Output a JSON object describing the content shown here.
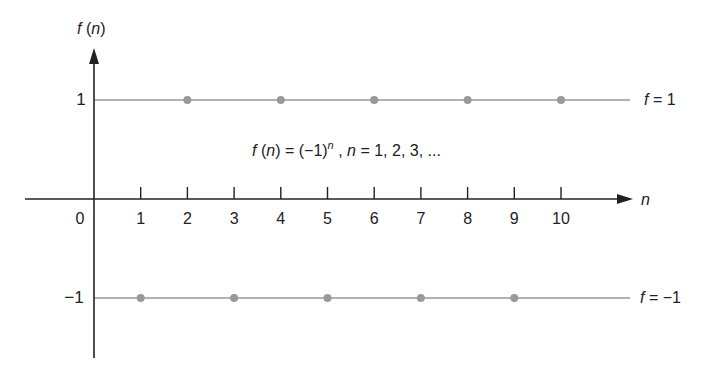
{
  "chart_data": {
    "type": "scatter",
    "xlabel": "n",
    "ylabel": "f (n)",
    "x": [
      1,
      2,
      3,
      4,
      5,
      6,
      7,
      8,
      9,
      10
    ],
    "series": [
      {
        "name": "f(n)",
        "values": [
          -1,
          1,
          -1,
          1,
          -1,
          1,
          -1,
          1,
          -1,
          1
        ]
      }
    ],
    "x_ticks": [
      "1",
      "2",
      "3",
      "4",
      "5",
      "6",
      "7",
      "8",
      "9",
      "10"
    ],
    "y_ticks": [
      "1",
      "−1"
    ],
    "origin_label": "0",
    "reference_lines": [
      {
        "y": 1,
        "label": "f = 1"
      },
      {
        "y": -1,
        "label": "f = −1"
      }
    ],
    "xlim": [
      0,
      11
    ],
    "ylim": [
      -1.8,
      1.5
    ],
    "grid": false,
    "legend": "none"
  },
  "labels": {
    "y_axis": "f (n)",
    "x_axis": "n",
    "origin": "0",
    "y_pos": "1",
    "y_neg": "−1",
    "line_pos": "f = 1",
    "line_neg": "f = −1",
    "equation_main": "f (n) = (−1)",
    "equation_sup": "n",
    "equation_tail": " , n = 1, 2, 3, ..."
  },
  "colors": {
    "axis": "#222222",
    "reference_line": "#999999",
    "point": "#999999"
  }
}
